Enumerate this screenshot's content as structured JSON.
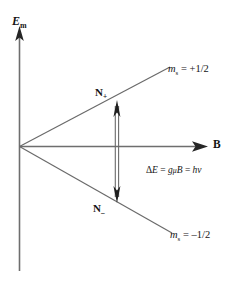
{
  "figure": {
    "type": "energy-level-splitting-diagram",
    "title_text": "",
    "background_color": "#ffffff",
    "line_color": "#3c3c3c",
    "text_color": "#141414"
  },
  "axes": {
    "y": {
      "label_main": "E",
      "label_sub": "m",
      "name": "Em",
      "direction": "up"
    },
    "x": {
      "label_main": "B",
      "name": "B",
      "direction": "right"
    }
  },
  "levels": [
    {
      "id": "upper",
      "label_main": "m",
      "label_sub": "s",
      "label_value": " = +1/2",
      "full_text": "ms = +1/2",
      "population_label_main": "N",
      "population_label_sub": "+",
      "population_full_text": "N+"
    },
    {
      "id": "lower",
      "label_main": "m",
      "label_sub": "s",
      "label_value": " = –1/2",
      "full_text": "ms = –1/2",
      "population_label_main": "N",
      "population_label_sub": "–",
      "population_full_text": "N–"
    }
  ],
  "transition": {
    "arrow_style": "double-headed-vertical",
    "equation": {
      "delta": "Δ",
      "e": "E",
      "eq1": " = ",
      "g": "g",
      "mu": "μ",
      "b": "B",
      "eq2": " = ",
      "h": "h",
      "nu": "ν",
      "full_text": "ΔE = gμB = hν"
    }
  }
}
